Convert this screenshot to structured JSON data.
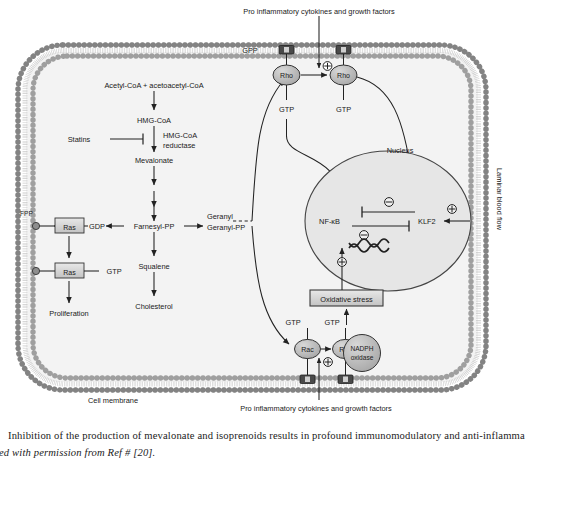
{
  "figure": {
    "title_top": "Pro inflammatory cytokines and growth factors",
    "title_bottom": "Pro inflammatory cytokines and growth factors",
    "membrane_label": "Cell membrane",
    "flow_label": "Laminar blood flow",
    "nucleus_label": "Nucleus"
  },
  "mevalonate_pathway": {
    "n1": "Acetyl-CoA + acetoacetyl-CoA",
    "n2": "HMG-CoA",
    "n3": "Mevalonate",
    "n4": "Farnesyl-PP",
    "n5": "Squalene",
    "n6": "Cholesterol",
    "enzyme": "HMG-CoA",
    "enzyme2": "reductase",
    "inhibitor": "Statins"
  },
  "branch": {
    "geranyl_line1": "Geranyl",
    "geranyl_line2": "Geranyl-PP",
    "gdp": "GDP",
    "gtp": "GTP",
    "ras1": "Ras",
    "ras2": "Ras",
    "fpp": "FPP",
    "proliferation": "Proliferation"
  },
  "gtpases": {
    "gpp": "GPP",
    "rho1": "Rho",
    "rho2": "Rho",
    "rho1_gtp": "GTP",
    "rho2_gtp": "GTP",
    "rac1": "Rac",
    "rac2": "Rac",
    "rac1_gtp": "GTP",
    "rac2_gtp": "GTP",
    "nadph_line1": "NADPH",
    "nadph_line2": "oxidase",
    "oxidative_stress": "Oxidative stress"
  },
  "nucleus": {
    "nfkb": "NF-κB",
    "klf2": "KLF2",
    "plus": "⊕",
    "minus": "⊖"
  },
  "caption": {
    "line1": "Inhibition of the production of mevalonate and isoprenoids results in profound immunomodulatory and anti-inflamma",
    "line2": "ed with permission from Ref # [20]."
  },
  "colors": {
    "membrane": "#8a8a8a",
    "cytoplasm": "#f2f2f2",
    "nucleus_fill": "#e4e4e4",
    "node_fill": "#bdbdbd",
    "box_fill": "#d9d9d9",
    "stroke": "#222222"
  }
}
